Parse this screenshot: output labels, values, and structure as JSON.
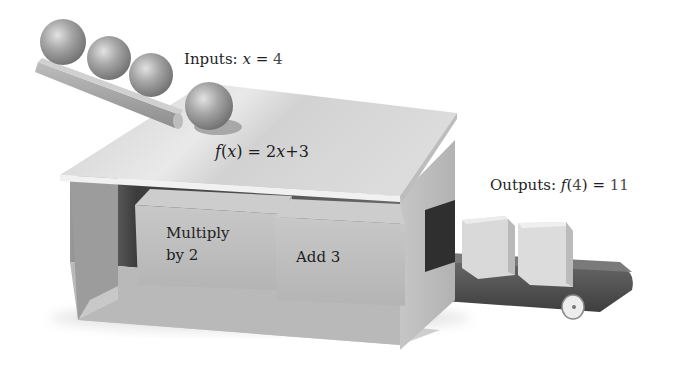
{
  "diagram": {
    "inputs": {
      "prefix": "Inputs:",
      "variable": "x",
      "equals": "=",
      "value": "4",
      "ball_count": 4
    },
    "function": {
      "name": "f",
      "open": "(",
      "variable": "x",
      "close": ")",
      "rhs": "= 2",
      "rhs_var": "x",
      "rhs_tail": "+3",
      "full_text": "f(x) = 2x+3"
    },
    "steps": [
      {
        "label_line1": "Multiply",
        "label_line2": "by 2"
      },
      {
        "label_line1": "Add 3",
        "label_line2": ""
      }
    ],
    "outputs": {
      "prefix": "Outputs:",
      "name": "f",
      "open": "(",
      "arg": "4",
      "close": ")",
      "equals": "=",
      "value": "11",
      "cube_count": 2
    },
    "colors": {
      "background": "#ffffff",
      "box_top": "#d9d9d9",
      "box_side": "#bdbdbd",
      "box_inner_dark": "#3a3a3a",
      "block_face": "#c4c4c4",
      "ball": "#9a9a9a",
      "belt": "#555555",
      "text": "#1f1f1f"
    }
  }
}
